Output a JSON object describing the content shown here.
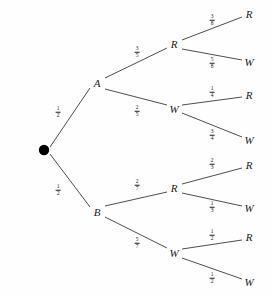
{
  "diagram": {
    "type": "probability-tree",
    "root": {
      "symbol": "",
      "x": 44,
      "y": 150
    },
    "nodes": [
      {
        "id": "A",
        "label": "A",
        "x": 97,
        "y": 83,
        "level": 1
      },
      {
        "id": "B",
        "label": "B",
        "x": 97,
        "y": 212,
        "level": 1
      },
      {
        "id": "A-R",
        "label": "R",
        "x": 174,
        "y": 44,
        "level": 2
      },
      {
        "id": "A-W",
        "label": "W",
        "x": 174,
        "y": 109,
        "level": 2
      },
      {
        "id": "B-R",
        "label": "R",
        "x": 174,
        "y": 188,
        "level": 2
      },
      {
        "id": "B-W",
        "label": "W",
        "x": 174,
        "y": 253,
        "level": 2
      },
      {
        "id": "A-R-R",
        "label": "R",
        "x": 249,
        "y": 14,
        "level": 3
      },
      {
        "id": "A-R-W",
        "label": "W",
        "x": 249,
        "y": 62,
        "level": 3
      },
      {
        "id": "A-W-R",
        "label": "R",
        "x": 249,
        "y": 95,
        "level": 3
      },
      {
        "id": "A-W-W",
        "label": "W",
        "x": 249,
        "y": 140,
        "level": 3
      },
      {
        "id": "B-R-R",
        "label": "R",
        "x": 249,
        "y": 165,
        "level": 3
      },
      {
        "id": "B-R-W",
        "label": "W",
        "x": 249,
        "y": 208,
        "level": 3
      },
      {
        "id": "B-W-R",
        "label": "R",
        "x": 249,
        "y": 237,
        "level": 3
      },
      {
        "id": "B-W-W",
        "label": "W",
        "x": 249,
        "y": 282,
        "level": 3
      }
    ],
    "edges": [
      {
        "from": "root",
        "to": "A",
        "x1": 50,
        "y1": 147,
        "x2": 90,
        "y2": 88
      },
      {
        "from": "root",
        "to": "B",
        "x1": 50,
        "y1": 154,
        "x2": 90,
        "y2": 207
      },
      {
        "from": "A",
        "to": "A-R",
        "x1": 105,
        "y1": 78,
        "x2": 167,
        "y2": 48
      },
      {
        "from": "A",
        "to": "A-W",
        "x1": 105,
        "y1": 89,
        "x2": 167,
        "y2": 105
      },
      {
        "from": "B",
        "to": "B-R",
        "x1": 105,
        "y1": 206,
        "x2": 167,
        "y2": 192
      },
      {
        "from": "B",
        "to": "B-W",
        "x1": 105,
        "y1": 217,
        "x2": 167,
        "y2": 248
      },
      {
        "from": "A-R",
        "to": "A-R-R",
        "x1": 182,
        "y1": 40,
        "x2": 242,
        "y2": 17
      },
      {
        "from": "A-R",
        "to": "A-R-W",
        "x1": 182,
        "y1": 49,
        "x2": 242,
        "y2": 60
      },
      {
        "from": "A-W",
        "to": "A-W-R",
        "x1": 182,
        "y1": 105,
        "x2": 242,
        "y2": 97
      },
      {
        "from": "A-W",
        "to": "A-W-W",
        "x1": 182,
        "y1": 113,
        "x2": 242,
        "y2": 137
      },
      {
        "from": "B-R",
        "to": "B-R-R",
        "x1": 182,
        "y1": 184,
        "x2": 242,
        "y2": 168
      },
      {
        "from": "B-R",
        "to": "B-R-W",
        "x1": 182,
        "y1": 193,
        "x2": 242,
        "y2": 206
      },
      {
        "from": "B-W",
        "to": "B-W-R",
        "x1": 182,
        "y1": 249,
        "x2": 242,
        "y2": 240
      },
      {
        "from": "B-W",
        "to": "B-W-W",
        "x1": 182,
        "y1": 258,
        "x2": 242,
        "y2": 279
      }
    ],
    "edge_labels": [
      {
        "id": "p-root-A",
        "numerator": "1",
        "denominator": "2",
        "x": 58,
        "y": 112
      },
      {
        "id": "p-root-B",
        "numerator": "1",
        "denominator": "2",
        "x": 58,
        "y": 190
      },
      {
        "id": "p-A-R",
        "numerator": "3",
        "denominator": "5",
        "x": 137,
        "y": 52
      },
      {
        "id": "p-A-W",
        "numerator": "2",
        "denominator": "5",
        "x": 137,
        "y": 111
      },
      {
        "id": "p-B-R",
        "numerator": "2",
        "denominator": "7",
        "x": 137,
        "y": 185
      },
      {
        "id": "p-B-W",
        "numerator": "5",
        "denominator": "7",
        "x": 137,
        "y": 243
      },
      {
        "id": "p-A-R-R",
        "numerator": "3",
        "denominator": "8",
        "x": 212,
        "y": 20
      },
      {
        "id": "p-A-R-W",
        "numerator": "5",
        "denominator": "8",
        "x": 212,
        "y": 63
      },
      {
        "id": "p-A-W-R",
        "numerator": "1",
        "denominator": "4",
        "x": 212,
        "y": 92
      },
      {
        "id": "p-A-W-W",
        "numerator": "3",
        "denominator": "4",
        "x": 212,
        "y": 135
      },
      {
        "id": "p-B-R-R",
        "numerator": "2",
        "denominator": "3",
        "x": 212,
        "y": 164
      },
      {
        "id": "p-B-R-W",
        "numerator": "1",
        "denominator": "3",
        "x": 212,
        "y": 207
      },
      {
        "id": "p-B-W-R",
        "numerator": "1",
        "denominator": "2",
        "x": 212,
        "y": 235
      },
      {
        "id": "p-B-W-W",
        "numerator": "1",
        "denominator": "2",
        "x": 212,
        "y": 278
      }
    ],
    "colors": {
      "line": "#3a3a3a",
      "text": "#1a1a1a",
      "background": "#fefefe",
      "root_dot": "#000000"
    }
  }
}
